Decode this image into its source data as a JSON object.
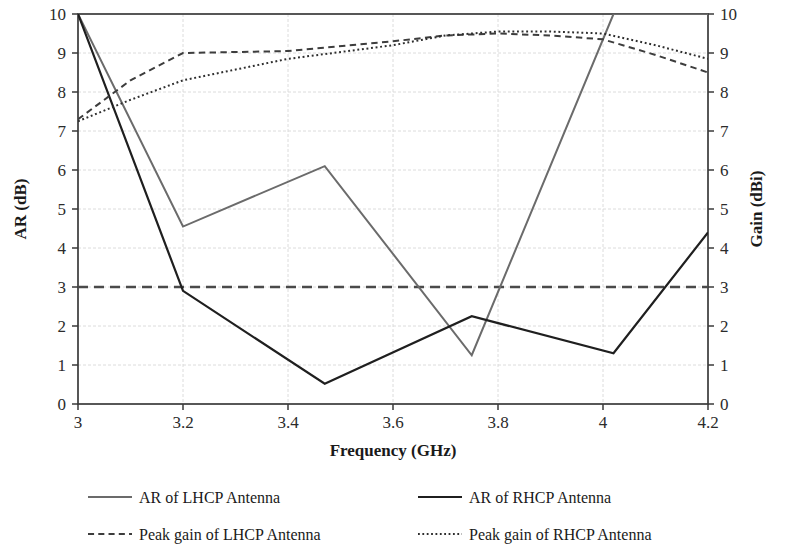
{
  "chart_data": {
    "type": "line",
    "title": "",
    "xlabel": "Frequency (GHz)",
    "ylabel": "AR (dB)",
    "y2label": "Gain (dBi)",
    "xlim": [
      3.0,
      4.2
    ],
    "ylim": [
      0,
      10
    ],
    "y2lim": [
      0,
      10
    ],
    "grid": true,
    "legend_position": "bottom",
    "xticks": [
      "3",
      "3.2",
      "3.4",
      "3.6",
      "3.8",
      "4",
      "4.2"
    ],
    "xtick_values": [
      3,
      3.2,
      3.4,
      3.6,
      3.8,
      4,
      4.2
    ],
    "yticks": [
      "0",
      "1",
      "2",
      "3",
      "4",
      "5",
      "6",
      "7",
      "8",
      "9",
      "10"
    ],
    "ytick_values": [
      0,
      1,
      2,
      3,
      4,
      5,
      6,
      7,
      8,
      9,
      10
    ],
    "y2ticks": [
      "0",
      "1",
      "2",
      "3",
      "4",
      "5",
      "6",
      "7",
      "8",
      "9",
      "10"
    ],
    "y2tick_values": [
      0,
      1,
      2,
      3,
      4,
      5,
      6,
      7,
      8,
      9,
      10
    ],
    "threshold_line": {
      "name": "3 dB axial ratio threshold",
      "value": 3,
      "style": "dashed",
      "color": "#4a4a4a"
    },
    "series": [
      {
        "name": "AR of LHCP Antenna",
        "axis": "left",
        "style": "solid",
        "color": "#6b6b6b",
        "width": 2.0,
        "x": [
          3.0,
          3.2,
          3.47,
          3.75,
          4.02,
          4.2
        ],
        "y": [
          10.0,
          4.55,
          6.1,
          1.25,
          10.0,
          10.0
        ]
      },
      {
        "name": "AR of RHCP Antenna",
        "axis": "left",
        "style": "solid",
        "color": "#1f1f1f",
        "width": 2.2,
        "x": [
          3.0,
          3.2,
          3.47,
          3.75,
          4.02,
          4.2
        ],
        "y": [
          10.0,
          2.9,
          0.52,
          2.25,
          1.3,
          4.4
        ]
      },
      {
        "name": "Peak gain of LHCP Antenna",
        "axis": "right",
        "style": "dashed",
        "color": "#3d3d3d",
        "width": 2.0,
        "x": [
          3.0,
          3.1,
          3.2,
          3.4,
          3.6,
          3.7,
          3.8,
          3.9,
          4.0,
          4.1,
          4.2
        ],
        "y": [
          7.3,
          8.3,
          9.0,
          9.05,
          9.3,
          9.45,
          9.5,
          9.45,
          9.35,
          8.95,
          8.5
        ]
      },
      {
        "name": "Peak gain of RHCP Antenna",
        "axis": "right",
        "style": "dotted",
        "color": "#2e2e2e",
        "width": 2.0,
        "x": [
          3.0,
          3.1,
          3.2,
          3.4,
          3.6,
          3.7,
          3.8,
          3.9,
          4.0,
          4.1,
          4.2
        ],
        "y": [
          7.25,
          7.8,
          8.3,
          8.85,
          9.2,
          9.45,
          9.55,
          9.55,
          9.5,
          9.2,
          8.85
        ]
      }
    ]
  },
  "legend": {
    "entries": [
      {
        "label": "AR of LHCP Antenna",
        "style": "solid",
        "color": "#6b6b6b"
      },
      {
        "label": "AR of RHCP Antenna",
        "style": "solid",
        "color": "#1f1f1f"
      },
      {
        "label": "Peak gain of LHCP Antenna",
        "style": "dashed",
        "color": "#3d3d3d"
      },
      {
        "label": "Peak gain of RHCP Antenna",
        "style": "dotted",
        "color": "#2e2e2e"
      }
    ]
  },
  "plot_box": {
    "left": 78,
    "top": 14,
    "right": 708,
    "bottom": 404
  }
}
